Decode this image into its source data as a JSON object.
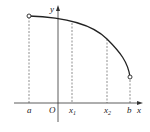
{
  "figure": {
    "axis_labels": {
      "x": "x",
      "y": "y",
      "origin": "O"
    },
    "points": [
      {
        "name": "a",
        "label": "a",
        "sub": ""
      },
      {
        "name": "x1",
        "label": "x",
        "sub": "1"
      },
      {
        "name": "x2",
        "label": "x",
        "sub": "2"
      },
      {
        "name": "b",
        "label": "b",
        "sub": ""
      }
    ],
    "curve": {
      "description": "decreasing concave-down curve from a to b",
      "endpoints": "open circles at a and b"
    },
    "colors": {
      "stroke": "#222222",
      "background": "#ffffff"
    }
  }
}
